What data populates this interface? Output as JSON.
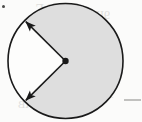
{
  "figure": {
    "name": "circle-with-shaded-sector",
    "caption": "",
    "background_color": "#fbfbfa",
    "ink_color": "#1a1a1a",
    "shaded_fill": "#dedede",
    "unshaded_fill": "#fdfdfc",
    "stroke_width": 1.6
  },
  "circle": {
    "center_x": 65.5,
    "center_y": 61,
    "radius": 57.5,
    "label": ""
  },
  "center_dot": {
    "radius": 3.2,
    "label": ""
  },
  "sector": {
    "shaded_start_deg": 225,
    "shaded_end_deg": 135,
    "shaded_sweep_deg": 270,
    "unshaded_start_deg": 135,
    "unshaded_end_deg": 225,
    "unshaded_sweep_deg": 90,
    "angle_label": ""
  },
  "radii": [
    {
      "name": "upper-radius-arrow",
      "angle_deg": 135,
      "from_x": 65.5,
      "from_y": 61,
      "to_x": 25.8,
      "to_y": 21.6,
      "arrowhead": "outward",
      "label": ""
    },
    {
      "name": "lower-radius-arrow",
      "angle_deg": 225,
      "from_x": 65.5,
      "from_y": 61,
      "to_x": 25.8,
      "to_y": 100.4,
      "arrowhead": "outward",
      "label": ""
    }
  ],
  "margin_marks": [
    {
      "name": "right-rule-segment",
      "x1": 124,
      "y1": 100,
      "x2": 141,
      "y2": 100,
      "color": "#9a9a98"
    },
    {
      "name": "corner-speck",
      "cx": 3.5,
      "cy": 6.5,
      "r": 1.5,
      "color": "#4a4a48"
    }
  ],
  "bleed_through": [
    {
      "text": "ΛΓ",
      "x": 36,
      "y": 2,
      "size": 14
    },
    {
      "text": "9ІІ",
      "x": 96,
      "y": 8,
      "size": 12
    },
    {
      "text": "БЕ",
      "x": 30,
      "y": 36,
      "size": 11
    },
    {
      "text": "ЗИ",
      "x": 92,
      "y": 42,
      "size": 11
    },
    {
      "text": "ДОС",
      "x": 34,
      "y": 62,
      "size": 11
    },
    {
      "text": "Г",
      "x": 104,
      "y": 66,
      "size": 12
    },
    {
      "text": "ХНИ",
      "x": 30,
      "y": 78,
      "size": 11
    },
    {
      "text": "ЛАВ",
      "x": 18,
      "y": 98,
      "size": 11
    },
    {
      "text": "9",
      "x": 108,
      "y": 88,
      "size": 11
    }
  ]
}
